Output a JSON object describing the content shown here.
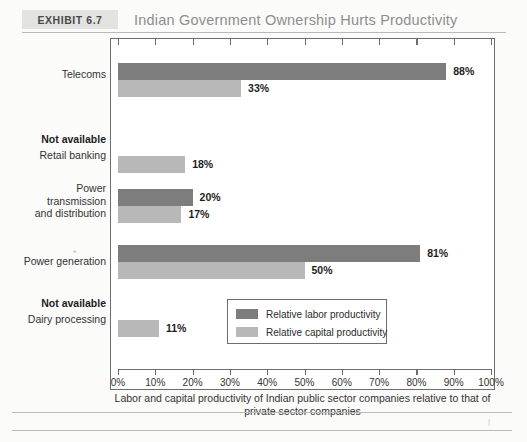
{
  "header": {
    "exhibit_tag": "Exhibit 6.7",
    "title": "Indian Government Ownership Hurts Productivity"
  },
  "legend": {
    "items": [
      {
        "label": "Relative labor productivity",
        "color": "#7d7d7d",
        "key": "labor"
      },
      {
        "label": "Relative capital productivity",
        "color": "#b8b8b8",
        "key": "capital"
      }
    ]
  },
  "axis_caption": "Labor and capital productivity of Indian public sector\ncompanies relative to that of private sector companies",
  "not_available_label": "Not available",
  "artifact": "*",
  "chart_data": {
    "type": "bar",
    "orientation": "horizontal",
    "title": "Indian Government Ownership Hurts Productivity",
    "xlabel": "Labor and capital productivity of Indian public sector companies relative to that of private sector companies",
    "ylabel": "",
    "xlim": [
      0,
      100
    ],
    "xtick_labels": [
      "0%",
      "10%",
      "20%",
      "30%",
      "40%",
      "50%",
      "60%",
      "70%",
      "80%",
      "90%",
      "100%"
    ],
    "xticks": [
      0,
      10,
      20,
      30,
      40,
      50,
      60,
      70,
      80,
      90,
      100
    ],
    "grid": false,
    "legend_position": "inside-lower-right",
    "categories": [
      "Telecoms",
      "Retail banking",
      "Power\ntransmission\nand distribution",
      "Power generation",
      "Dairy processing"
    ],
    "series": [
      {
        "name": "Relative labor productivity",
        "color": "#7d7d7d",
        "values": [
          88,
          null,
          20,
          81,
          null
        ],
        "value_labels": [
          "88%",
          "Not available",
          "20%",
          "81%",
          "Not available"
        ]
      },
      {
        "name": "Relative capital productivity",
        "color": "#b8b8b8",
        "values": [
          33,
          18,
          17,
          50,
          11
        ],
        "value_labels": [
          "33%",
          "18%",
          "17%",
          "50%",
          "11%"
        ]
      }
    ]
  }
}
